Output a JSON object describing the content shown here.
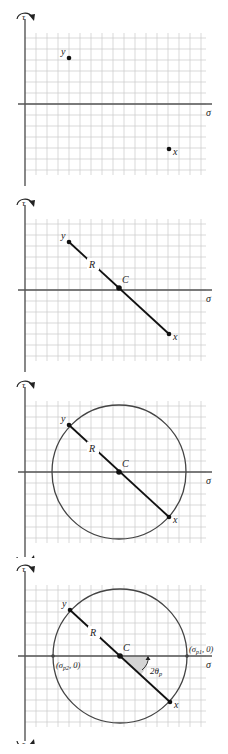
{
  "diagram": {
    "colors": {
      "grid": "#cfcfcf",
      "axis": "#555555",
      "line": "#111111",
      "circle": "#444444",
      "shade": "#d4d4d4"
    },
    "grid": {
      "x0": 22,
      "x1": 206,
      "cell": 11,
      "top_offset": 33,
      "rows": 13
    },
    "axis_labels": {
      "tau": "τ",
      "sigma": "σ"
    },
    "panels": [
      {
        "id": "step-1-plot-points",
        "top": 0,
        "axis_y": 104,
        "axis_x": 25,
        "points": [
          {
            "label": "y",
            "x": 69,
            "y": 58
          },
          {
            "label": "x",
            "x": 169,
            "y": 149
          }
        ],
        "show_diameter": false,
        "show_circle": false
      },
      {
        "id": "step-2-diameter",
        "top": 186,
        "axis_y": 104,
        "axis_x": 25,
        "points": [
          {
            "label": "y",
            "x": 69,
            "y": 56
          },
          {
            "label": "x",
            "x": 169,
            "y": 148
          }
        ],
        "center": {
          "label": "C",
          "x": 119,
          "y": 102
        },
        "radius_label": "R",
        "show_diameter": true,
        "show_circle": false
      },
      {
        "id": "step-3-circle",
        "top": 372,
        "axis_y": 100,
        "axis_x": 25,
        "points": [
          {
            "label": "y",
            "x": 69,
            "y": 53
          },
          {
            "label": "x",
            "x": 169,
            "y": 145
          }
        ],
        "center": {
          "label": "C",
          "x": 119,
          "y": 100
        },
        "radius_label": "R",
        "radius": 67,
        "show_diameter": true,
        "show_circle": true
      },
      {
        "id": "step-4-principal-stresses",
        "top": 558,
        "axis_y": 98,
        "axis_x": 25,
        "points": [
          {
            "label": "y",
            "x": 70,
            "y": 52
          },
          {
            "label": "x",
            "x": 170,
            "y": 144
          }
        ],
        "center": {
          "label": "C",
          "x": 120,
          "y": 98
        },
        "radius_label": "R",
        "radius": 67,
        "show_diameter": true,
        "show_circle": true,
        "principal_labels": {
          "sigma_p1": "(σp1, 0)",
          "sigma_p2": "(σp2, 0)",
          "angle": "2θp"
        }
      }
    ]
  }
}
